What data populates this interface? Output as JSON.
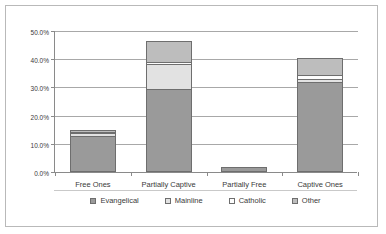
{
  "chart_data": {
    "type": "bar",
    "subtype": "stacked-column",
    "title": "",
    "xlabel": "",
    "ylabel": "",
    "categories": [
      "Free Ones",
      "Partially Captive",
      "Partially Free",
      "Captive Ones"
    ],
    "series": [
      {
        "name": "Evangelical",
        "color": "#9a9a9a",
        "values": [
          12.2,
          28.6,
          1.0,
          31.3
        ]
      },
      {
        "name": "Mainline",
        "color": "#e2e2e2",
        "values": [
          0.8,
          9.0,
          0.0,
          1.0
        ]
      },
      {
        "name": "Catholic",
        "color": "#fdfdfd",
        "values": [
          0.3,
          0.8,
          0.0,
          1.5
        ]
      },
      {
        "name": "Other",
        "color": "#bdbdbd",
        "values": [
          1.0,
          7.5,
          0.0,
          6.1
        ]
      }
    ],
    "totals": [
      14.3,
      45.9,
      1.0,
      39.9
    ],
    "ylim": [
      0,
      50
    ],
    "ytick_values": [
      0,
      10,
      20,
      30,
      40,
      50
    ],
    "ytick_labels": [
      "0.0%",
      "10.0%",
      "20.0%",
      "30.0%",
      "40.0%",
      "50.0%"
    ],
    "grid": true,
    "legend_position": "bottom",
    "legend_entries": [
      "Evangelical",
      "Mainline",
      "Catholic",
      "Other"
    ]
  },
  "legend": {
    "items": [
      {
        "label": "Evangelical",
        "key": "k-evangelical"
      },
      {
        "label": "Mainline",
        "key": "k-mainline"
      },
      {
        "label": "Catholic",
        "key": "k-catholic"
      },
      {
        "label": "Other",
        "key": "k-other"
      }
    ]
  },
  "colors": {
    "evangelical": "#9a9a9a",
    "mainline": "#e2e2e2",
    "catholic": "#fdfdfd",
    "other": "#bdbdbd",
    "axis": "#8a8a8a",
    "grid": "#a8a8a8",
    "frame": "#b9b9b9",
    "text": "#3a3a3a"
  }
}
